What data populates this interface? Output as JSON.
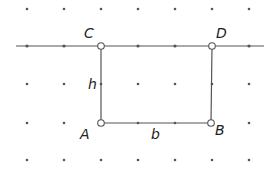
{
  "diagram": {
    "type": "geometry-dot-grid",
    "colors": {
      "background": "#ffffff",
      "line": "#555555",
      "grid_dot": "#555555",
      "label": "#222222"
    },
    "grid": {
      "columns_x": [
        27,
        64,
        101,
        138,
        175,
        212,
        249
      ],
      "rows_y": [
        9,
        46,
        84,
        123,
        160
      ]
    },
    "line": {
      "x1": 16,
      "y1": 46,
      "x2": 264,
      "y2": 46,
      "label": "line through C and D"
    },
    "rectangle": {
      "top_left": "C",
      "top_right": "D",
      "bottom_left": "A",
      "bottom_right": "B"
    },
    "points": [
      {
        "name": "C",
        "label": "C",
        "x": 101,
        "y": 46,
        "label_x": 84,
        "label_y": 38
      },
      {
        "name": "D",
        "label": "D",
        "x": 212,
        "y": 46,
        "label_x": 216,
        "label_y": 38
      },
      {
        "name": "A",
        "label": "A",
        "x": 101,
        "y": 123,
        "label_x": 80,
        "label_y": 139
      },
      {
        "name": "B",
        "label": "B",
        "x": 211,
        "y": 123,
        "label_x": 215,
        "label_y": 135
      }
    ],
    "side_labels": [
      {
        "name": "h",
        "label": "h",
        "side": "AC",
        "x": 88,
        "y": 89
      },
      {
        "name": "b",
        "label": "b",
        "side": "AB",
        "x": 151,
        "y": 139
      }
    ]
  }
}
